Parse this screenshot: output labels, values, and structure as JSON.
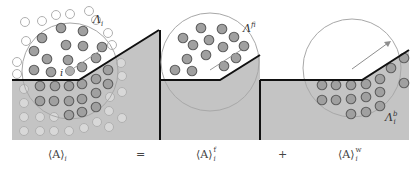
{
  "figure": {
    "panels": [
      {
        "id": "total",
        "region_label": "Λ",
        "region_subscript": "i",
        "particle_label": "i"
      },
      {
        "id": "fluid",
        "region_label": "Λ",
        "region_subscript": "i",
        "region_superscript": "f"
      },
      {
        "id": "wall",
        "region_label": "Λ",
        "region_subscript": "i",
        "region_superscript": "b"
      }
    ],
    "colors": {
      "wall_fill": "#c4c4c4",
      "boundary_line": "#111111",
      "particle_fill": "#a0a0a0",
      "particle_stroke": "#6a6a6a",
      "faint_particle_fill": "#d6d6d6",
      "faint_particle_stroke": "#b2b2b2",
      "circle_stroke": "#a8a8a8"
    }
  },
  "equation": {
    "lhs": "⟨A⟩",
    "lhs_sub": "i",
    "equals": "=",
    "term1": "⟨A⟩",
    "term1_sub": "i",
    "term1_sup": "f",
    "plus": "+",
    "term2": "⟨A⟩",
    "term2_sub": "i",
    "term2_sup": "w"
  }
}
